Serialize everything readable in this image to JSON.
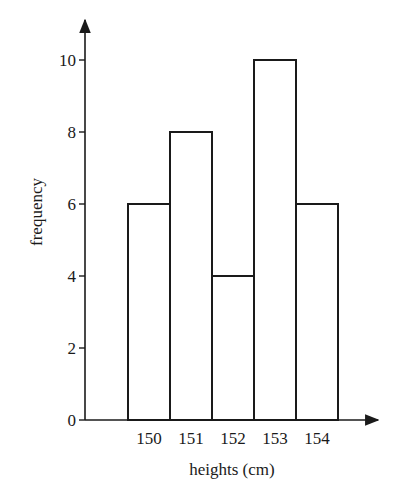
{
  "chart_data": {
    "type": "bar",
    "subtype": "histogram",
    "title": "",
    "xlabel": "heights (cm)",
    "ylabel": "frequency",
    "categories": [
      "150",
      "151",
      "152",
      "153",
      "154"
    ],
    "values": [
      6,
      8,
      4,
      10,
      6
    ],
    "yticks": [
      0,
      2,
      4,
      6,
      8,
      10
    ],
    "ylim": [
      0,
      11
    ],
    "grid": false,
    "legend": null,
    "bar_fill": "#ffffff",
    "bar_stroke": "#1a1a1a"
  }
}
